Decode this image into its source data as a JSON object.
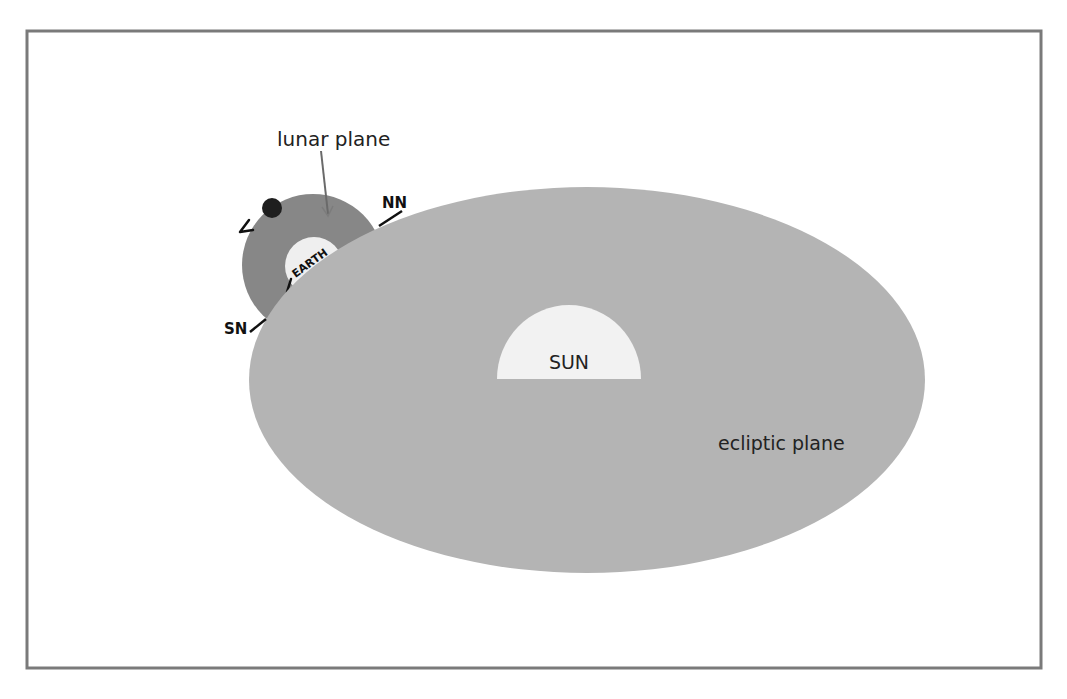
{
  "diagram": {
    "frame": {
      "x": 27,
      "y": 31,
      "width": 1014,
      "height": 637,
      "stroke": "#7a7a7a"
    },
    "colors": {
      "background": "#ffffff",
      "ecliptic_fill": "#b4b4b4",
      "lunar_plane_fill": "#878787",
      "earth_fill": "#efefef",
      "sun_fill": "#f2f2f2",
      "moon_fill": "#1e1e1e",
      "text": "#222222",
      "pointer": "#6a6a6a"
    },
    "labels": {
      "lunar_plane": "lunar plane",
      "earth": "EARTH",
      "north_node": "NN",
      "south_node": "SN",
      "sun": "SUN",
      "ecliptic_plane": "ecliptic plane"
    },
    "shapes": {
      "ecliptic_plane": {
        "cx": 587,
        "cy": 380,
        "rx": 338,
        "ry": 193
      },
      "lunar_plane": {
        "cx": 313,
        "cy": 265,
        "r": 71
      },
      "earth": {
        "cx": 314,
        "cy": 266,
        "r": 29
      },
      "moon": {
        "cx": 272,
        "cy": 208,
        "r": 10
      },
      "sun": {
        "cx": 569,
        "cy": 379,
        "rx": 72,
        "ry": 74
      }
    }
  }
}
